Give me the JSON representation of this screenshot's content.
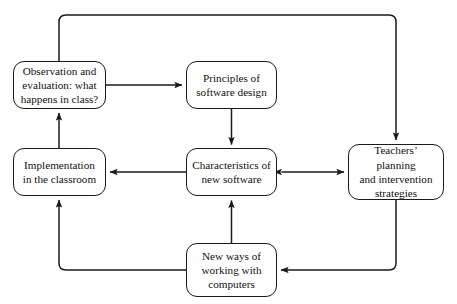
{
  "diagram": {
    "type": "flowchart",
    "background_color": "#ffffff",
    "stroke_color": "#1a1a1a",
    "text_color": "#111111",
    "nodes": [
      {
        "id": "observation",
        "label": "Observation and\nevaluation: what\nhappens in class?"
      },
      {
        "id": "principles",
        "label": "Principles of\nsoftware design"
      },
      {
        "id": "implementation",
        "label": "Implementation\nin the classroom"
      },
      {
        "id": "characteristics",
        "label": "Characteristics of\nnew software"
      },
      {
        "id": "teachers",
        "label": "Teachers’ planning\nand intervention\nstrategies"
      },
      {
        "id": "newways",
        "label": "New ways of\nworking with\ncomputers"
      }
    ],
    "edges": [
      {
        "id": "observation-to-principles",
        "from": "observation",
        "to": "principles",
        "direction": "one-way"
      },
      {
        "id": "principles-to-characteristics",
        "from": "principles",
        "to": "characteristics",
        "direction": "one-way"
      },
      {
        "id": "characteristics-to-implementation",
        "from": "characteristics",
        "to": "implementation",
        "direction": "one-way"
      },
      {
        "id": "characteristics-teachers",
        "from": "characteristics",
        "to": "teachers",
        "direction": "two-way"
      },
      {
        "id": "newways-to-characteristics",
        "from": "newways",
        "to": "characteristics",
        "direction": "one-way"
      },
      {
        "id": "implementation-to-observation",
        "from": "implementation",
        "to": "observation",
        "direction": "one-way"
      },
      {
        "id": "observation-to-teachers",
        "from": "observation",
        "to": "teachers",
        "direction": "one-way",
        "routing": "around-top"
      },
      {
        "id": "teachers-to-newways",
        "from": "teachers",
        "to": "newways",
        "direction": "one-way",
        "routing": "around-bottom-right"
      },
      {
        "id": "newways-to-implementation",
        "from": "newways",
        "to": "implementation",
        "direction": "one-way",
        "routing": "around-bottom-left"
      }
    ]
  }
}
